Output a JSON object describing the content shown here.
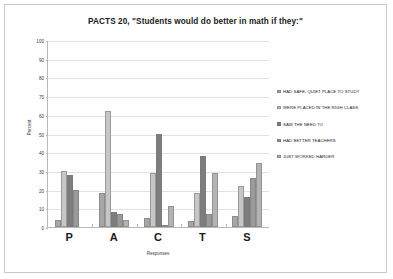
{
  "chart_data": {
    "type": "bar",
    "title": "PACTS 20, \"Students would do better in math if they:\"",
    "xlabel": "Responses",
    "ylabel": "Percent",
    "categories": [
      "P",
      "A",
      "C",
      "T",
      "S"
    ],
    "ylim": [
      0,
      100
    ],
    "yticks": [
      0,
      10,
      20,
      30,
      40,
      50,
      60,
      70,
      80,
      90,
      100
    ],
    "grid": true,
    "legend_position": "right",
    "series": [
      {
        "name": "HAD SAFE, QUIET PLACE TO STUDY",
        "color": "#a6a6a6",
        "values": [
          4,
          18,
          5,
          3,
          6
        ]
      },
      {
        "name": "WERE PLACED IN THE RIGH CLASS",
        "color": "#c6c6c6",
        "values": [
          30,
          62,
          29,
          18,
          22
        ]
      },
      {
        "name": "SAW THE NEED TO",
        "color": "#7d7d7d",
        "values": [
          28,
          8,
          50,
          38,
          16
        ]
      },
      {
        "name": "HAD BETTER TEACHERS",
        "color": "#9a9a9a",
        "values": [
          20,
          7,
          1,
          7,
          26
        ]
      },
      {
        "name": "JUST WORKED HARDER",
        "color": "#b3b3b3",
        "values": [
          0,
          4,
          11,
          29,
          34
        ]
      }
    ]
  }
}
